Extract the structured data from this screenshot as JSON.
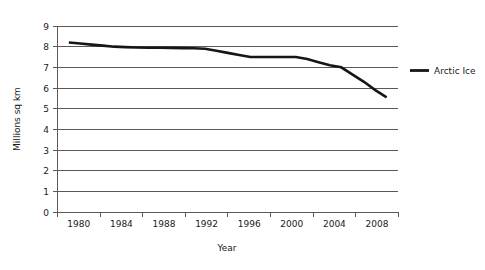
{
  "chart_data": {
    "type": "line",
    "title": "",
    "xlabel": "Year",
    "ylabel": "Millions sq km",
    "x": [
      1980,
      1981,
      1982,
      1983,
      1984,
      1985,
      1986,
      1987,
      1988,
      1989,
      1990,
      1991,
      1992,
      1993,
      1994,
      1995,
      1996,
      1997,
      1998,
      1999,
      2000,
      2001,
      2002,
      2003,
      2004,
      2005,
      2006,
      2007,
      2008
    ],
    "series": [
      {
        "name": "Arctic Ice",
        "color": "#161616",
        "values": [
          8.2,
          8.15,
          8.1,
          8.05,
          8.0,
          7.98,
          7.96,
          7.95,
          7.95,
          7.94,
          7.93,
          7.92,
          7.9,
          7.8,
          7.7,
          7.6,
          7.5,
          7.5,
          7.5,
          7.5,
          7.5,
          7.4,
          7.25,
          7.1,
          7.0,
          6.65,
          6.3,
          5.9,
          5.55
        ]
      }
    ],
    "xlim": [
      1979,
      2009
    ],
    "ylim": [
      0,
      9
    ],
    "xticks": [
      1980,
      1984,
      1988,
      1992,
      1996,
      2000,
      2004,
      2008
    ],
    "xtick_labels": [
      "1980",
      "1984",
      "1988",
      "1992",
      "1996",
      "2000",
      "2004",
      "2008"
    ],
    "yticks": [
      0,
      1,
      2,
      3,
      4,
      5,
      6,
      7,
      8,
      9
    ],
    "ytick_labels": [
      "0",
      "1",
      "2",
      "3",
      "4",
      "5",
      "6",
      "7",
      "8",
      "9"
    ],
    "grid": "horizontal",
    "legend_position": "right",
    "legend_entries": [
      "Arctic Ice"
    ],
    "colors": {
      "series": "#161616",
      "grid": "#595959",
      "axis": "#595959",
      "text": "#1a1a1a",
      "background": "#ffffff"
    }
  }
}
